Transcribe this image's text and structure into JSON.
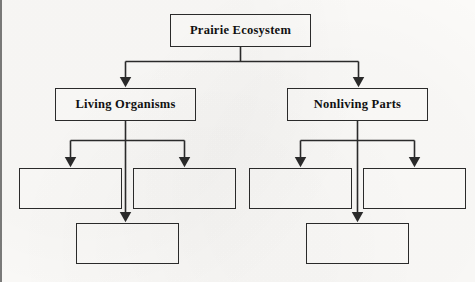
{
  "worksheet": {
    "type": "hierarchy-flowchart",
    "background_color": "#fbfaf8",
    "line_color": "#2b2b2b",
    "text_color": "#111111"
  },
  "diagram": {
    "root": {
      "label": "Prairie Ecosystem",
      "filled": true
    },
    "branches": [
      {
        "label": "Living Organisms",
        "filled": true,
        "children": [
          {
            "label": "",
            "filled": false
          },
          {
            "label": "",
            "filled": false
          },
          {
            "label": "",
            "filled": false
          }
        ]
      },
      {
        "label": "Nonliving Parts",
        "filled": true,
        "children": [
          {
            "label": "",
            "filled": false
          },
          {
            "label": "",
            "filled": false
          },
          {
            "label": "",
            "filled": false
          }
        ]
      }
    ]
  }
}
